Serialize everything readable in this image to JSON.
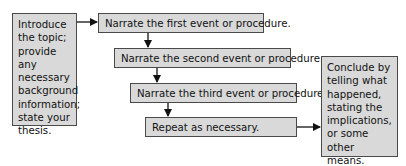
{
  "diagram": {
    "intro": {
      "lines": [
        "Introduce",
        "the topic;",
        "provide any",
        "necessary",
        "background",
        "information;",
        "state your",
        "thesis."
      ]
    },
    "steps": [
      {
        "label": "Narrate the first event or procedure."
      },
      {
        "label": "Narrate the second event or procedure."
      },
      {
        "label": "Narrate the third event or procedure."
      },
      {
        "label": "Repeat as necessary."
      }
    ],
    "conclusion": {
      "lines": [
        "Conclude by",
        "telling what",
        "happened,",
        "stating the",
        "implications,",
        "or some other",
        "means."
      ]
    },
    "colors": {
      "box_fill": "#d9d9d9",
      "box_border": "#4a4a4a",
      "arrow": "#111111"
    }
  }
}
